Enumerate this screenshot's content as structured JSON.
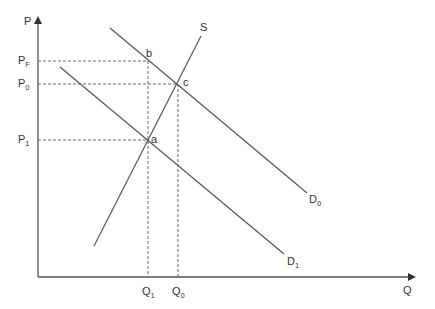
{
  "diagram": {
    "type": "supply-demand",
    "axes": {
      "y_label": "P",
      "x_label": "Q"
    },
    "curves": [
      {
        "id": "S",
        "label": "S",
        "kind": "supply"
      },
      {
        "id": "D0",
        "label": "D",
        "label_sub": "0",
        "kind": "demand"
      },
      {
        "id": "D1",
        "label": "D",
        "label_sub": "1",
        "kind": "demand"
      }
    ],
    "price_levels": [
      {
        "id": "PF",
        "label": "P",
        "label_sub": "F"
      },
      {
        "id": "P0",
        "label": "P",
        "label_sub": "0"
      },
      {
        "id": "P1",
        "label": "P",
        "label_sub": "1"
      }
    ],
    "quantity_levels": [
      {
        "id": "Q1",
        "label": "Q",
        "label_sub": "1"
      },
      {
        "id": "Q0",
        "label": "Q",
        "label_sub": "0"
      }
    ],
    "points": [
      {
        "id": "a",
        "label": "a",
        "on": [
          "S",
          "D1"
        ],
        "at": [
          "Q1",
          "P1"
        ]
      },
      {
        "id": "b",
        "label": "b",
        "on": [
          "D0"
        ],
        "at": [
          "Q1",
          "PF"
        ]
      },
      {
        "id": "c",
        "label": "c",
        "on": [
          "S",
          "D0"
        ],
        "at": [
          "Q0",
          "P0"
        ]
      }
    ],
    "colors": {
      "line": "#555555",
      "dash": "#666666",
      "axis": "#555555",
      "text": "#333333"
    }
  }
}
